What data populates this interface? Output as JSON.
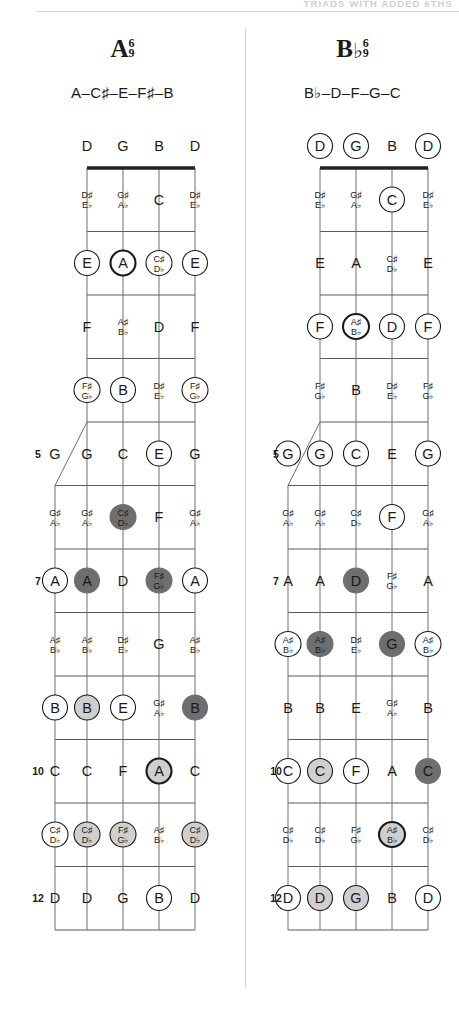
{
  "header": {
    "running_head": "TRIADS WITH ADDED 6THS"
  },
  "layout": {
    "string_positions": [
      87,
      123,
      159,
      195
    ],
    "fifth_string_x": 55,
    "fifth_string_start_fret": 5,
    "nut_y": 168,
    "fret_spacing": 63.5,
    "fret_count": 12,
    "note_row_offset": 32
  },
  "colors": {
    "ink": "#1a1a1a",
    "fret": "#5a5a5a",
    "string": "#6e6e6e",
    "nut": "#222222",
    "fill_none": "#ffffff",
    "fill_light": "#cfcfcf",
    "fill_dark": "#6e6e6e",
    "rule": "#d8d8dc",
    "divider": "#d2d2d6",
    "head_text": "#cfcfd4"
  },
  "panels": [
    {
      "id": "a6-9",
      "name_root": "A",
      "name_flat": "",
      "name_sup_top": "6",
      "name_sup_bottom": "9",
      "spelling": "A–C♯–E–F♯–B",
      "open_strings": [
        {
          "label": "D",
          "marker": "none"
        },
        {
          "label": "G",
          "marker": "none"
        },
        {
          "label": "B",
          "marker": "none"
        },
        {
          "label": "D",
          "marker": "none"
        }
      ],
      "fret_numbers": [
        5,
        7,
        10,
        12
      ],
      "notes": [
        {
          "fret": 1,
          "string": 1,
          "label": [
            "D♯",
            "E♭"
          ],
          "marker": "none"
        },
        {
          "fret": 1,
          "string": 2,
          "label": [
            "G♯",
            "A♭"
          ],
          "marker": "none"
        },
        {
          "fret": 1,
          "string": 3,
          "label": [
            "C"
          ],
          "marker": "none"
        },
        {
          "fret": 1,
          "string": 4,
          "label": [
            "D♯",
            "E♭"
          ],
          "marker": "none"
        },
        {
          "fret": 2,
          "string": 1,
          "label": [
            "E"
          ],
          "marker": "open"
        },
        {
          "fret": 2,
          "string": 2,
          "label": [
            "A"
          ],
          "marker": "open-bold"
        },
        {
          "fret": 2,
          "string": 3,
          "label": [
            "C♯",
            "D♭"
          ],
          "marker": "open"
        },
        {
          "fret": 2,
          "string": 4,
          "label": [
            "E"
          ],
          "marker": "open"
        },
        {
          "fret": 3,
          "string": 1,
          "label": [
            "F"
          ],
          "marker": "none"
        },
        {
          "fret": 3,
          "string": 2,
          "label": [
            "A♯",
            "B♭"
          ],
          "marker": "none"
        },
        {
          "fret": 3,
          "string": 3,
          "label": [
            "D"
          ],
          "marker": "none"
        },
        {
          "fret": 3,
          "string": 4,
          "label": [
            "F"
          ],
          "marker": "none"
        },
        {
          "fret": 4,
          "string": 1,
          "label": [
            "F♯",
            "G♭"
          ],
          "marker": "open"
        },
        {
          "fret": 4,
          "string": 2,
          "label": [
            "B"
          ],
          "marker": "open"
        },
        {
          "fret": 4,
          "string": 3,
          "label": [
            "D♯",
            "E♭"
          ],
          "marker": "none"
        },
        {
          "fret": 4,
          "string": 4,
          "label": [
            "F♯",
            "G♭"
          ],
          "marker": "open"
        },
        {
          "fret": 5,
          "string": 0,
          "label": [
            "G"
          ],
          "marker": "none"
        },
        {
          "fret": 5,
          "string": 1,
          "label": [
            "G"
          ],
          "marker": "none"
        },
        {
          "fret": 5,
          "string": 2,
          "label": [
            "C"
          ],
          "marker": "none"
        },
        {
          "fret": 5,
          "string": 3,
          "label": [
            "E"
          ],
          "marker": "open"
        },
        {
          "fret": 5,
          "string": 4,
          "label": [
            "G"
          ],
          "marker": "none"
        },
        {
          "fret": 6,
          "string": 0,
          "label": [
            "G♯",
            "A♭"
          ],
          "marker": "none"
        },
        {
          "fret": 6,
          "string": 1,
          "label": [
            "G♯",
            "A♭"
          ],
          "marker": "none"
        },
        {
          "fret": 6,
          "string": 2,
          "label": [
            "C♯",
            "D♭"
          ],
          "marker": "dark"
        },
        {
          "fret": 6,
          "string": 3,
          "label": [
            "F"
          ],
          "marker": "none"
        },
        {
          "fret": 6,
          "string": 4,
          "label": [
            "G♯",
            "A♭"
          ],
          "marker": "none"
        },
        {
          "fret": 7,
          "string": 0,
          "label": [
            "A"
          ],
          "marker": "open"
        },
        {
          "fret": 7,
          "string": 1,
          "label": [
            "A"
          ],
          "marker": "dark"
        },
        {
          "fret": 7,
          "string": 2,
          "label": [
            "D"
          ],
          "marker": "none"
        },
        {
          "fret": 7,
          "string": 3,
          "label": [
            "F♯",
            "G♭"
          ],
          "marker": "dark"
        },
        {
          "fret": 7,
          "string": 4,
          "label": [
            "A"
          ],
          "marker": "open"
        },
        {
          "fret": 8,
          "string": 0,
          "label": [
            "A♯",
            "B♭"
          ],
          "marker": "none"
        },
        {
          "fret": 8,
          "string": 1,
          "label": [
            "A♯",
            "B♭"
          ],
          "marker": "none"
        },
        {
          "fret": 8,
          "string": 2,
          "label": [
            "D♯",
            "E♭"
          ],
          "marker": "none"
        },
        {
          "fret": 8,
          "string": 3,
          "label": [
            "G"
          ],
          "marker": "none"
        },
        {
          "fret": 8,
          "string": 4,
          "label": [
            "A♯",
            "B♭"
          ],
          "marker": "none"
        },
        {
          "fret": 9,
          "string": 0,
          "label": [
            "B"
          ],
          "marker": "open"
        },
        {
          "fret": 9,
          "string": 1,
          "label": [
            "B"
          ],
          "marker": "light"
        },
        {
          "fret": 9,
          "string": 2,
          "label": [
            "E"
          ],
          "marker": "open"
        },
        {
          "fret": 9,
          "string": 3,
          "label": [
            "G♯",
            "A♭"
          ],
          "marker": "none"
        },
        {
          "fret": 9,
          "string": 4,
          "label": [
            "B"
          ],
          "marker": "dark"
        },
        {
          "fret": 10,
          "string": 0,
          "label": [
            "C"
          ],
          "marker": "none"
        },
        {
          "fret": 10,
          "string": 1,
          "label": [
            "C"
          ],
          "marker": "none"
        },
        {
          "fret": 10,
          "string": 2,
          "label": [
            "F"
          ],
          "marker": "none"
        },
        {
          "fret": 10,
          "string": 3,
          "label": [
            "A"
          ],
          "marker": "light-bold"
        },
        {
          "fret": 10,
          "string": 4,
          "label": [
            "C"
          ],
          "marker": "none"
        },
        {
          "fret": 11,
          "string": 0,
          "label": [
            "C♯",
            "D♭"
          ],
          "marker": "open"
        },
        {
          "fret": 11,
          "string": 1,
          "label": [
            "C♯",
            "D♭"
          ],
          "marker": "light"
        },
        {
          "fret": 11,
          "string": 2,
          "label": [
            "F♯",
            "G♭"
          ],
          "marker": "light"
        },
        {
          "fret": 11,
          "string": 3,
          "label": [
            "A♯",
            "B♭"
          ],
          "marker": "none"
        },
        {
          "fret": 11,
          "string": 4,
          "label": [
            "C♯",
            "D♭"
          ],
          "marker": "light"
        },
        {
          "fret": 12,
          "string": 0,
          "label": [
            "D"
          ],
          "marker": "none"
        },
        {
          "fret": 12,
          "string": 1,
          "label": [
            "D"
          ],
          "marker": "none"
        },
        {
          "fret": 12,
          "string": 2,
          "label": [
            "G"
          ],
          "marker": "none"
        },
        {
          "fret": 12,
          "string": 3,
          "label": [
            "B"
          ],
          "marker": "open"
        },
        {
          "fret": 12,
          "string": 4,
          "label": [
            "D"
          ],
          "marker": "none"
        }
      ]
    },
    {
      "id": "bb6-9",
      "name_root": "B",
      "name_flat": "♭",
      "name_sup_top": "6",
      "name_sup_bottom": "9",
      "spelling": "B♭–D–F–G–C",
      "open_strings": [
        {
          "label": "D",
          "marker": "open"
        },
        {
          "label": "G",
          "marker": "open"
        },
        {
          "label": "B",
          "marker": "none"
        },
        {
          "label": "D",
          "marker": "open"
        }
      ],
      "fret_numbers": [
        5,
        7,
        10,
        12
      ],
      "notes": [
        {
          "fret": 1,
          "string": 1,
          "label": [
            "D♯",
            "E♭"
          ],
          "marker": "none"
        },
        {
          "fret": 1,
          "string": 2,
          "label": [
            "G♯",
            "A♭"
          ],
          "marker": "none"
        },
        {
          "fret": 1,
          "string": 3,
          "label": [
            "C"
          ],
          "marker": "open"
        },
        {
          "fret": 1,
          "string": 4,
          "label": [
            "D♯",
            "E♭"
          ],
          "marker": "none"
        },
        {
          "fret": 2,
          "string": 1,
          "label": [
            "E"
          ],
          "marker": "none"
        },
        {
          "fret": 2,
          "string": 2,
          "label": [
            "A"
          ],
          "marker": "none"
        },
        {
          "fret": 2,
          "string": 3,
          "label": [
            "C♯",
            "D♭"
          ],
          "marker": "none"
        },
        {
          "fret": 2,
          "string": 4,
          "label": [
            "E"
          ],
          "marker": "none"
        },
        {
          "fret": 3,
          "string": 1,
          "label": [
            "F"
          ],
          "marker": "open"
        },
        {
          "fret": 3,
          "string": 2,
          "label": [
            "A♯",
            "B♭"
          ],
          "marker": "open-bold"
        },
        {
          "fret": 3,
          "string": 3,
          "label": [
            "D"
          ],
          "marker": "open"
        },
        {
          "fret": 3,
          "string": 4,
          "label": [
            "F"
          ],
          "marker": "open"
        },
        {
          "fret": 4,
          "string": 1,
          "label": [
            "F♯",
            "G♭"
          ],
          "marker": "none"
        },
        {
          "fret": 4,
          "string": 2,
          "label": [
            "B"
          ],
          "marker": "none"
        },
        {
          "fret": 4,
          "string": 3,
          "label": [
            "D♯",
            "E♭"
          ],
          "marker": "none"
        },
        {
          "fret": 4,
          "string": 4,
          "label": [
            "F♯",
            "G♭"
          ],
          "marker": "none"
        },
        {
          "fret": 5,
          "string": 0,
          "label": [
            "G"
          ],
          "marker": "open"
        },
        {
          "fret": 5,
          "string": 1,
          "label": [
            "G"
          ],
          "marker": "open"
        },
        {
          "fret": 5,
          "string": 2,
          "label": [
            "C"
          ],
          "marker": "open"
        },
        {
          "fret": 5,
          "string": 3,
          "label": [
            "E"
          ],
          "marker": "none"
        },
        {
          "fret": 5,
          "string": 4,
          "label": [
            "G"
          ],
          "marker": "open"
        },
        {
          "fret": 6,
          "string": 0,
          "label": [
            "G♯",
            "A♭"
          ],
          "marker": "none"
        },
        {
          "fret": 6,
          "string": 1,
          "label": [
            "G♯",
            "A♭"
          ],
          "marker": "none"
        },
        {
          "fret": 6,
          "string": 2,
          "label": [
            "C♯",
            "D♭"
          ],
          "marker": "none"
        },
        {
          "fret": 6,
          "string": 3,
          "label": [
            "F"
          ],
          "marker": "open"
        },
        {
          "fret": 6,
          "string": 4,
          "label": [
            "G♯",
            "A♭"
          ],
          "marker": "none"
        },
        {
          "fret": 7,
          "string": 0,
          "label": [
            "A"
          ],
          "marker": "none"
        },
        {
          "fret": 7,
          "string": 1,
          "label": [
            "A"
          ],
          "marker": "none"
        },
        {
          "fret": 7,
          "string": 2,
          "label": [
            "D"
          ],
          "marker": "dark"
        },
        {
          "fret": 7,
          "string": 3,
          "label": [
            "F♯",
            "G♭"
          ],
          "marker": "none"
        },
        {
          "fret": 7,
          "string": 4,
          "label": [
            "A"
          ],
          "marker": "none"
        },
        {
          "fret": 8,
          "string": 0,
          "label": [
            "A♯",
            "B♭"
          ],
          "marker": "open"
        },
        {
          "fret": 8,
          "string": 1,
          "label": [
            "A♯",
            "B♭"
          ],
          "marker": "dark"
        },
        {
          "fret": 8,
          "string": 2,
          "label": [
            "D♯",
            "E♭"
          ],
          "marker": "none"
        },
        {
          "fret": 8,
          "string": 3,
          "label": [
            "G"
          ],
          "marker": "dark"
        },
        {
          "fret": 8,
          "string": 4,
          "label": [
            "A♯",
            "B♭"
          ],
          "marker": "open"
        },
        {
          "fret": 9,
          "string": 0,
          "label": [
            "B"
          ],
          "marker": "none"
        },
        {
          "fret": 9,
          "string": 1,
          "label": [
            "B"
          ],
          "marker": "none"
        },
        {
          "fret": 9,
          "string": 2,
          "label": [
            "E"
          ],
          "marker": "none"
        },
        {
          "fret": 9,
          "string": 3,
          "label": [
            "G♯",
            "A♭"
          ],
          "marker": "none"
        },
        {
          "fret": 9,
          "string": 4,
          "label": [
            "B"
          ],
          "marker": "none"
        },
        {
          "fret": 10,
          "string": 0,
          "label": [
            "C"
          ],
          "marker": "open"
        },
        {
          "fret": 10,
          "string": 1,
          "label": [
            "C"
          ],
          "marker": "light"
        },
        {
          "fret": 10,
          "string": 2,
          "label": [
            "F"
          ],
          "marker": "open"
        },
        {
          "fret": 10,
          "string": 3,
          "label": [
            "A"
          ],
          "marker": "none"
        },
        {
          "fret": 10,
          "string": 4,
          "label": [
            "C"
          ],
          "marker": "dark"
        },
        {
          "fret": 11,
          "string": 0,
          "label": [
            "C♯",
            "D♭"
          ],
          "marker": "none"
        },
        {
          "fret": 11,
          "string": 1,
          "label": [
            "C♯",
            "D♭"
          ],
          "marker": "none"
        },
        {
          "fret": 11,
          "string": 2,
          "label": [
            "F♯",
            "G♭"
          ],
          "marker": "none"
        },
        {
          "fret": 11,
          "string": 3,
          "label": [
            "A♯",
            "B♭"
          ],
          "marker": "light-bold"
        },
        {
          "fret": 11,
          "string": 4,
          "label": [
            "C♯",
            "D♭"
          ],
          "marker": "none"
        },
        {
          "fret": 12,
          "string": 0,
          "label": [
            "D"
          ],
          "marker": "open"
        },
        {
          "fret": 12,
          "string": 1,
          "label": [
            "D"
          ],
          "marker": "light"
        },
        {
          "fret": 12,
          "string": 2,
          "label": [
            "G"
          ],
          "marker": "light"
        },
        {
          "fret": 12,
          "string": 3,
          "label": [
            "B"
          ],
          "marker": "none"
        },
        {
          "fret": 12,
          "string": 4,
          "label": [
            "D"
          ],
          "marker": "open"
        }
      ]
    }
  ]
}
